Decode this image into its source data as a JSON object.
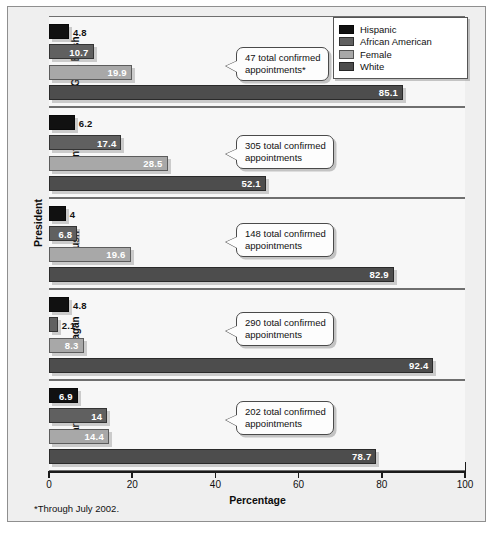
{
  "chart_data": {
    "type": "bar",
    "orientation": "horizontal",
    "title": "",
    "xlabel": "Percentage",
    "ylabel": "President",
    "xlim": [
      0,
      100
    ],
    "xticks": [
      "0",
      "20",
      "40",
      "60",
      "80",
      "100"
    ],
    "grid": false,
    "legend_position": "top-right",
    "categories": [
      "G.W. Bush",
      "Clinton",
      "Bush",
      "Reagan",
      "Carter"
    ],
    "series": [
      {
        "name": "Hispanic",
        "color": "#111111",
        "values": [
          4.8,
          6.2,
          4,
          4.8,
          6.9
        ],
        "labels": [
          "4.8",
          "6.2",
          "4",
          "4.8",
          "6.9"
        ]
      },
      {
        "name": "African American",
        "color": "#606060",
        "values": [
          10.7,
          17.4,
          6.8,
          2.1,
          14
        ],
        "labels": [
          "10.7",
          "17.4",
          "6.8",
          "2.1",
          "14"
        ]
      },
      {
        "name": "Female",
        "color": "#a8a8a8",
        "values": [
          19.9,
          28.5,
          19.6,
          8.3,
          14.4
        ],
        "labels": [
          "19.9",
          "28.5",
          "19.6",
          "8.3",
          "14.4"
        ]
      },
      {
        "name": "White",
        "color": "#4d4d4d",
        "values": [
          85.1,
          52.1,
          82.9,
          92.4,
          78.7
        ],
        "labels": [
          "85.1",
          "52.1",
          "82.9",
          "92.4",
          "78.7"
        ]
      }
    ],
    "annotations": [
      {
        "category": "G.W. Bush",
        "text": "47 total confirmed\nappointments*"
      },
      {
        "category": "Clinton",
        "text": "305 total confirmed\nappointments"
      },
      {
        "category": "Bush",
        "text": "148 total confirmed\nappointments"
      },
      {
        "category": "Reagan",
        "text": "290 total confirmed\nappointments"
      },
      {
        "category": "Carter",
        "text": "202 total confirmed\nappointments"
      }
    ],
    "footnote": "*Through July 2002."
  }
}
